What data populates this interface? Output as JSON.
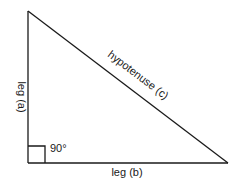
{
  "diagram": {
    "type": "right-triangle",
    "colors": {
      "line": "#1a1a1a",
      "background": "#ffffff",
      "text": "#1a1a1a"
    },
    "vertices": {
      "top": [
        28,
        11
      ],
      "right_angle": [
        28,
        163
      ],
      "bottom_right": [
        228,
        163
      ]
    },
    "labels": {
      "leg_a": "leg (a)",
      "leg_b": "leg (b)",
      "hypotenuse": "hypotenuse (c)",
      "angle": "90°"
    }
  }
}
